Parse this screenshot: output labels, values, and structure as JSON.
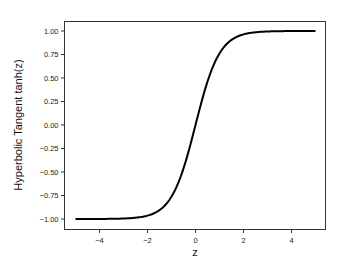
{
  "chart_data": {
    "type": "line",
    "title": "",
    "xlabel": "z",
    "ylabel": "Hyperbolic Tangent tanh(z)",
    "xlim": [
      -5.45,
      5.45
    ],
    "ylim": [
      -1.1,
      1.1
    ],
    "grid": false,
    "legend": null,
    "x_ticks": [
      -4,
      -2,
      0,
      2,
      4
    ],
    "x_tick_labels": [
      "−4",
      "−2",
      "0",
      "2",
      "4"
    ],
    "y_ticks": [
      1.0,
      0.75,
      0.5,
      0.25,
      0.0,
      -0.25,
      -0.5,
      -0.75,
      -1.0
    ],
    "y_tick_labels": [
      "1.00",
      "0.75",
      "0.50",
      "0.25",
      "0.00",
      "−0.25",
      "−0.50",
      "−0.75",
      "−1.00"
    ],
    "series": [
      {
        "name": "tanh(z)",
        "color": "#000000",
        "function": "tanh",
        "x": [
          -5,
          -4,
          -3,
          -2,
          -1.5,
          -1,
          -0.5,
          0,
          0.5,
          1,
          1.5,
          2,
          3,
          4,
          5
        ],
        "y": [
          -0.9999,
          -0.9993,
          -0.9951,
          -0.964,
          -0.9051,
          -0.7616,
          -0.4621,
          0.0,
          0.4621,
          0.7616,
          0.9051,
          0.964,
          0.9951,
          0.9993,
          0.9999
        ]
      }
    ]
  }
}
